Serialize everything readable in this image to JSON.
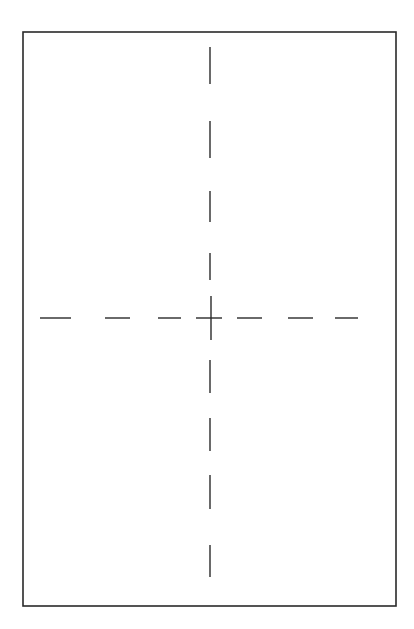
{
  "diagram": {
    "type": "page-layout-crosshair",
    "colors": {
      "background": "#ffffff",
      "stroke": "#2a2a2a"
    },
    "frame": {
      "x1": 23,
      "y1": 32,
      "x2": 396,
      "y2": 606,
      "stroke_width": 1.6
    },
    "center_mark": {
      "x": 211,
      "y": 318,
      "h_extent": [
        196,
        222
      ],
      "v_extent": [
        296,
        340
      ]
    },
    "horizontal_axis": {
      "y": 318,
      "dashes": [
        [
          40,
          71
        ],
        [
          105,
          130
        ],
        [
          158,
          181
        ],
        [
          237,
          262
        ],
        [
          288,
          313
        ],
        [
          335,
          358
        ]
      ]
    },
    "vertical_axis": {
      "x": 210,
      "dashes": [
        [
          47,
          84
        ],
        [
          121,
          158
        ],
        [
          191,
          222
        ],
        [
          253,
          280
        ],
        [
          360,
          393
        ],
        [
          418,
          451
        ],
        [
          475,
          509
        ],
        [
          545,
          577
        ]
      ]
    }
  }
}
